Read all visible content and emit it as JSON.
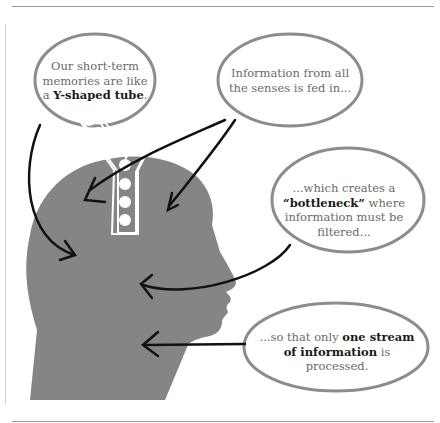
{
  "diagram": {
    "bubbles": [
      {
        "id": "y-tube",
        "pre": "Our short-term memories are like ",
        "bold": "Y-shaped tube",
        "lead": "a ",
        "post": "."
      },
      {
        "id": "senses",
        "text": "Information from all the senses is fed in..."
      },
      {
        "id": "bottleneck",
        "pre": "...which creates a ",
        "bold": "“bottleneck”",
        "post": " where information must be filtered..."
      },
      {
        "id": "one-stream",
        "pre": "...so that only ",
        "bold": "one stream of information",
        "post": " is processed."
      }
    ],
    "colors": {
      "head": "#858585",
      "bubble_outline": "#8c8c8c",
      "arrow": "#111111",
      "tube": "#ffffff"
    }
  }
}
